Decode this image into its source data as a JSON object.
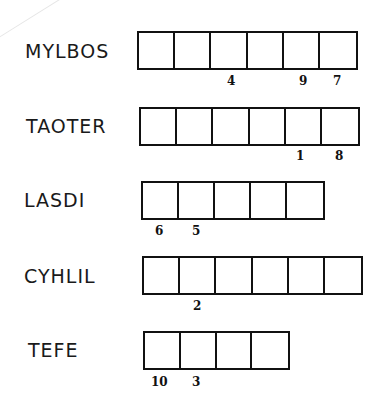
{
  "puzzle": {
    "words": [
      {
        "label": "MYLBOS",
        "cell_count": 6,
        "label_pos": {
          "x": 25,
          "y": 41
        },
        "grid_pos": {
          "x": 137,
          "y": 31,
          "width": 221
        },
        "numbers": [
          {
            "value": "4",
            "x": 227,
            "y": 75
          },
          {
            "value": "9",
            "x": 299,
            "y": 75
          },
          {
            "value": "7",
            "x": 333,
            "y": 75
          }
        ]
      },
      {
        "label": "TAOTER",
        "cell_count": 6,
        "label_pos": {
          "x": 26,
          "y": 116
        },
        "grid_pos": {
          "x": 139,
          "y": 107,
          "width": 221
        },
        "numbers": [
          {
            "value": "1",
            "x": 296,
            "y": 150
          },
          {
            "value": "8",
            "x": 335,
            "y": 150
          }
        ]
      },
      {
        "label": "LASDI",
        "cell_count": 5,
        "label_pos": {
          "x": 24,
          "y": 190
        },
        "grid_pos": {
          "x": 141,
          "y": 181,
          "width": 184
        },
        "numbers": [
          {
            "value": "6",
            "x": 155,
            "y": 225
          },
          {
            "value": "5",
            "x": 192,
            "y": 225
          }
        ]
      },
      {
        "label": "CYHLIL",
        "cell_count": 6,
        "label_pos": {
          "x": 24,
          "y": 266
        },
        "grid_pos": {
          "x": 142,
          "y": 256,
          "width": 221
        },
        "numbers": [
          {
            "value": "2",
            "x": 193,
            "y": 300
          }
        ]
      },
      {
        "label": "TEFE",
        "cell_count": 4,
        "label_pos": {
          "x": 28,
          "y": 340
        },
        "grid_pos": {
          "x": 143,
          "y": 331,
          "width": 147
        },
        "numbers": [
          {
            "value": "10",
            "x": 151,
            "y": 376
          },
          {
            "value": "3",
            "x": 192,
            "y": 376
          }
        ]
      }
    ]
  },
  "colors": {
    "background": "#ffffff",
    "ink": "#111111",
    "faint_line": "#e6e6e6"
  }
}
